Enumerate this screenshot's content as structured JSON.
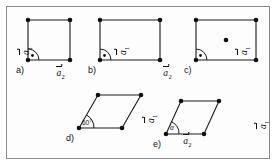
{
  "figure": {
    "border_color": "#8a8a8a",
    "line_color": "#1a1a1a",
    "node_color": "#111111",
    "background": "#ffffff"
  },
  "vectors": {
    "a1": "a",
    "a1_sub": "1",
    "a2": "a",
    "a2_sub": "2"
  },
  "panels": [
    {
      "id": "a",
      "letter": "a)",
      "shape": "square",
      "label_a1": "a",
      "label_a1_sub": "1",
      "label_a2": "a",
      "label_a2_sub": "2",
      "angle_marker": "right-angle",
      "angle_text": "",
      "centered": false
    },
    {
      "id": "b",
      "letter": "b)",
      "shape": "rectangle",
      "label_a1": "a",
      "label_a1_sub": "1",
      "label_a2": "a",
      "label_a2_sub": "2",
      "angle_marker": "right-angle",
      "angle_text": "",
      "centered": false
    },
    {
      "id": "c",
      "letter": "c)",
      "shape": "centered-rectangle",
      "label_a1": "a",
      "label_a1_sub": "1",
      "label_a2": "a",
      "label_a2_sub": "2",
      "angle_marker": "right-angle",
      "angle_text": "",
      "centered": true
    },
    {
      "id": "d",
      "letter": "d)",
      "shape": "rhombus-60",
      "label_a1": "a",
      "label_a1_sub": "1",
      "label_a2": "a",
      "label_a2_sub": "2",
      "angle_marker": "arc",
      "angle_text": "60°",
      "centered": false
    },
    {
      "id": "e",
      "letter": "e)",
      "shape": "oblique",
      "label_a1": "a",
      "label_a1_sub": "1",
      "label_a2": "a",
      "label_a2_sub": "2",
      "angle_marker": "arc",
      "angle_text": "α",
      "centered": false
    }
  ]
}
